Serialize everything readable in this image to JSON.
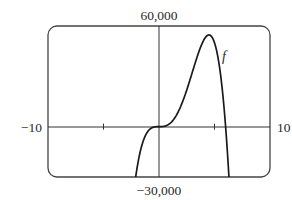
{
  "chart_data": {
    "type": "line",
    "title": "",
    "xlabel": "",
    "ylabel": "",
    "xlim": [
      -10,
      10
    ],
    "ylim": [
      -30000,
      60000
    ],
    "grid": false,
    "legend": "none",
    "tick_labels": {
      "x_min": "−10",
      "x_max": "10",
      "y_max": "60,000",
      "y_min": "−30,000"
    },
    "x_ticks": [
      -5,
      5
    ],
    "series": [
      {
        "name": "f",
        "label_annotation": "f",
        "formula_estimate": "400*x^3*(6-x)",
        "x": [
          -2.12,
          -2,
          -1.5,
          -1,
          -0.5,
          0,
          0.5,
          1,
          1.5,
          2,
          2.5,
          3,
          3.5,
          4,
          4.5,
          5,
          5.5,
          6,
          6.5
        ],
        "values": [
          -30000,
          -25600,
          -10125,
          -2800,
          -325,
          0,
          275,
          2000,
          6075,
          12800,
          21875,
          32400,
          42875,
          51200,
          54675,
          50000,
          33275,
          0,
          -54925
        ]
      }
    ]
  },
  "labels": {
    "y_max": "60,000",
    "y_min": "−30,000",
    "x_min": "−10",
    "x_max": "10",
    "curve": "f"
  },
  "colors": {
    "curve": "#1a1a1a",
    "axes": "#333333",
    "frame": "#444444",
    "background": "#ffffff"
  }
}
